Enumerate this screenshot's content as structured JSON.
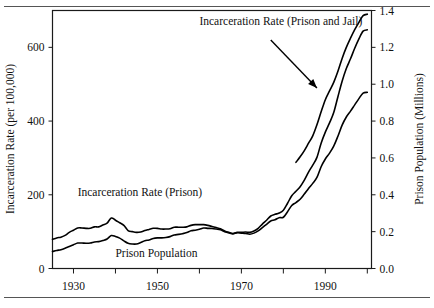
{
  "figure": {
    "rule_top": "horizontal-rule",
    "rule_bottom": "horizontal-rule"
  },
  "chart_data": {
    "type": "line",
    "title": "",
    "xlabel": "",
    "ylabel": "Incarceration Rate (per 100,000)",
    "y2label": "Prison Population (Millions)",
    "xlim": [
      1925,
      2001
    ],
    "ylim": [
      0,
      700
    ],
    "y2lim": [
      0.0,
      1.4
    ],
    "grid": false,
    "legend_position": "inline-annotations",
    "xticks": [
      1930,
      1940,
      1950,
      1960,
      1970,
      1980,
      1990,
      2000
    ],
    "xticklabels": [
      "1930",
      "",
      "1950",
      "",
      "1970",
      "",
      "1990",
      ""
    ],
    "yticks": [
      0,
      200,
      400,
      600
    ],
    "yticklabels": [
      "0",
      "200",
      "400",
      "600"
    ],
    "y2ticks": [
      0.0,
      0.2,
      0.4,
      0.6,
      0.8,
      1.0,
      1.2,
      1.4
    ],
    "y2ticklabels": [
      "0.0",
      "0.2",
      "0.4",
      "0.6",
      "0.8",
      "1.0",
      "1.2",
      "1.4"
    ],
    "annotations": [
      {
        "id": "annot-prison-and-jail",
        "text": "Incarceration Rate (Prison and Jail)",
        "x": 1960,
        "y": 660,
        "arrow_from": [
          1977,
          620
        ],
        "arrow_to": [
          1988,
          490
        ]
      },
      {
        "id": "annot-prison",
        "text": "Incarceration Rate (Prison)",
        "x": 1931,
        "y": 196
      },
      {
        "id": "annot-prison-population",
        "text": "Prison Population",
        "x": 1940,
        "y": 32
      }
    ],
    "series": [
      {
        "name": "Incarceration Rate (Prison and Jail)",
        "axis": "left",
        "units": "per 100,000",
        "x": [
          1983,
          1984,
          1985,
          1986,
          1987,
          1988,
          1989,
          1990,
          1991,
          1992,
          1993,
          1994,
          1995,
          1996,
          1997,
          1998,
          1999,
          2000
        ],
        "y": [
          288,
          303,
          320,
          340,
          360,
          390,
          425,
          458,
          482,
          505,
          535,
          570,
          600,
          625,
          648,
          668,
          686,
          690
        ]
      },
      {
        "name": "Incarceration Rate (Prison)",
        "axis": "left",
        "units": "per 100,000",
        "x": [
          1925,
          1926,
          1927,
          1928,
          1929,
          1930,
          1931,
          1932,
          1933,
          1934,
          1935,
          1936,
          1937,
          1938,
          1939,
          1940,
          1941,
          1942,
          1943,
          1944,
          1945,
          1946,
          1947,
          1948,
          1949,
          1950,
          1951,
          1952,
          1953,
          1954,
          1955,
          1956,
          1957,
          1958,
          1959,
          1960,
          1961,
          1962,
          1963,
          1964,
          1965,
          1966,
          1967,
          1968,
          1969,
          1970,
          1971,
          1972,
          1973,
          1974,
          1975,
          1976,
          1977,
          1978,
          1979,
          1980,
          1981,
          1982,
          1983,
          1984,
          1985,
          1986,
          1987,
          1988,
          1989,
          1990,
          1991,
          1992,
          1993,
          1994,
          1995,
          1996,
          1997,
          1998,
          1999,
          2000
        ],
        "y": [
          79,
          83,
          85,
          90,
          98,
          104,
          110,
          110,
          109,
          109,
          113,
          113,
          118,
          123,
          137,
          131,
          124,
          117,
          103,
          100,
          98,
          99,
          103,
          106,
          109,
          109,
          107,
          107,
          108,
          112,
          112,
          112,
          113,
          117,
          119,
          119,
          119,
          117,
          114,
          111,
          108,
          102,
          98,
          95,
          97,
          96,
          95,
          93,
          96,
          102,
          111,
          120,
          129,
          132,
          138,
          139,
          154,
          171,
          179,
          188,
          202,
          217,
          231,
          247,
          276,
          297,
          313,
          332,
          359,
          389,
          411,
          427,
          444,
          461,
          476,
          478
        ]
      },
      {
        "name": "Prison Population",
        "axis": "right",
        "units": "millions",
        "x": [
          1925,
          1926,
          1927,
          1928,
          1929,
          1930,
          1931,
          1932,
          1933,
          1934,
          1935,
          1936,
          1937,
          1938,
          1939,
          1940,
          1941,
          1942,
          1943,
          1944,
          1945,
          1946,
          1947,
          1948,
          1949,
          1950,
          1951,
          1952,
          1953,
          1954,
          1955,
          1956,
          1957,
          1958,
          1959,
          1960,
          1961,
          1962,
          1963,
          1964,
          1965,
          1966,
          1967,
          1968,
          1969,
          1970,
          1971,
          1972,
          1973,
          1974,
          1975,
          1976,
          1977,
          1978,
          1979,
          1980,
          1981,
          1982,
          1983,
          1984,
          1985,
          1986,
          1987,
          1988,
          1989,
          1990,
          1991,
          1992,
          1993,
          1994,
          1995,
          1996,
          1997,
          1998,
          1999,
          2000
        ],
        "y": [
          0.092,
          0.098,
          0.102,
          0.11,
          0.12,
          0.129,
          0.138,
          0.138,
          0.137,
          0.138,
          0.144,
          0.146,
          0.152,
          0.16,
          0.179,
          0.174,
          0.165,
          0.15,
          0.137,
          0.133,
          0.133,
          0.141,
          0.151,
          0.155,
          0.163,
          0.166,
          0.166,
          0.168,
          0.173,
          0.182,
          0.185,
          0.189,
          0.195,
          0.205,
          0.208,
          0.213,
          0.22,
          0.218,
          0.217,
          0.214,
          0.21,
          0.2,
          0.194,
          0.188,
          0.196,
          0.196,
          0.198,
          0.196,
          0.204,
          0.218,
          0.241,
          0.262,
          0.285,
          0.294,
          0.301,
          0.316,
          0.354,
          0.395,
          0.419,
          0.444,
          0.48,
          0.523,
          0.561,
          0.603,
          0.68,
          0.74,
          0.79,
          0.846,
          0.932,
          1.016,
          1.085,
          1.138,
          1.195,
          1.246,
          1.288,
          1.295
        ]
      }
    ]
  }
}
